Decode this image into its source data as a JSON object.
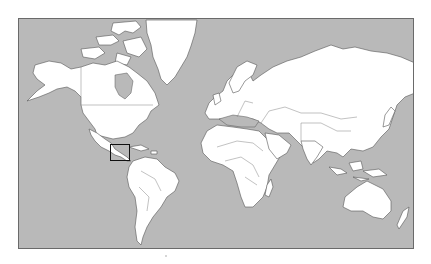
{
  "map": {
    "projection": "Mercator",
    "style": {
      "ocean_color": "#b9b9b9",
      "land_color": "#ffffff",
      "border_color": "#555555",
      "highlight_color": "#111111"
    },
    "highlight": {
      "region": "Central America",
      "box": {
        "x": 110,
        "y": 144,
        "width": 20,
        "height": 17
      }
    },
    "regions": [
      "North America",
      "Greenland",
      "South America",
      "Europe",
      "Africa",
      "Asia",
      "Australia",
      "New Zealand"
    ]
  }
}
